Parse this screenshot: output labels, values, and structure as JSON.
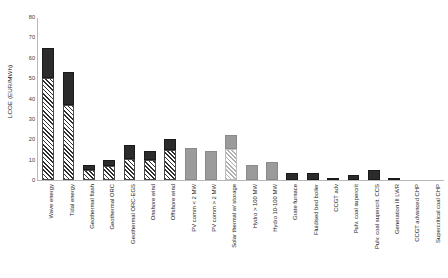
{
  "chart_data": {
    "type": "bar",
    "title": "",
    "subtitle": "",
    "xlabel": "",
    "ylabel": "LCOE (EUR/MWh)",
    "ylim": [
      0,
      80
    ],
    "ytick_values": [
      0,
      10,
      20,
      30,
      40,
      50,
      60,
      70,
      80
    ],
    "ytick_labels": [
      "0",
      "10",
      "20",
      "30",
      "40",
      "50",
      "60",
      "70",
      "80"
    ],
    "grid": false,
    "legend_position": "none",
    "stacked": true,
    "annotations": [],
    "categories": [
      "Wave energy",
      "Tidal energy",
      "Geothermal flash",
      "Geothermal ORC",
      "Geothermal ORC-EGS",
      "Onshore wind",
      "Offshore wind",
      "PV comm < 2 MW",
      "PV comm > 2 MW",
      "Solar thermal w/ storage",
      "Hydro > 100 MW",
      "Hydro 10-100 MW",
      "Grate furnace",
      "Fluidised bed boiler",
      "CCGT adv",
      "Pulv. coal supercrit",
      "Pulv. coal supercrit. CCS",
      "Generation III LWR",
      "CCGT advanced CHP",
      "Supercritical coal CHP"
    ],
    "series": [
      {
        "name": "lower segment (hatched)",
        "style": "hatched",
        "values": [
          50.0,
          37.0,
          5.0,
          7.0,
          10.5,
          10.0,
          14.5,
          0.0,
          0.0,
          15.0,
          0.0,
          0.0,
          0.0,
          0.0,
          0.0,
          0.0,
          0.0,
          0.0,
          0.0,
          0.0
        ]
      },
      {
        "name": "upper segment (solid)",
        "style": "solid",
        "values": [
          15.0,
          16.0,
          2.5,
          3.0,
          6.5,
          4.0,
          5.5,
          15.5,
          14.0,
          7.0,
          7.5,
          9.0,
          3.5,
          3.5,
          1.0,
          2.5,
          5.0,
          0.4,
          0.0,
          0.0
        ]
      }
    ],
    "totals": [
      65.0,
      53.0,
      7.5,
      10.0,
      17.0,
      14.0,
      20.0,
      15.5,
      14.0,
      22.0,
      7.5,
      9.0,
      3.5,
      3.5,
      1.0,
      2.5,
      5.0,
      0.4,
      0.0,
      0.0
    ],
    "bar_colors": {
      "dark_solid": "#2b2b2b",
      "gray_solid": "#9b9b9b",
      "dark_hatch": "#2f2f2f",
      "gray_hatch": "#b0b0b0"
    },
    "bar_color_groups": [
      "dark",
      "dark",
      "dark",
      "dark",
      "dark",
      "dark",
      "dark",
      "gray",
      "gray",
      "gray",
      "gray",
      "gray",
      "dark",
      "dark",
      "dark",
      "dark",
      "dark",
      "dark",
      "dark",
      "dark"
    ]
  }
}
